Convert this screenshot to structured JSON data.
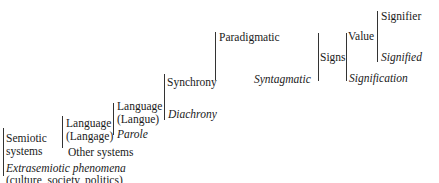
{
  "diagram": {
    "type": "hierarchical-bracket-tree",
    "nodes": {
      "semiotic_systems_1": "Semiotic",
      "semiotic_systems_2": "systems",
      "extrasemiotic": "Extrasemiotic phenomena",
      "extrasemiotic_sub": "(culture, society, politics)",
      "language_langage_1": "Language",
      "language_langage_2": "(Langage)",
      "other_systems": "Other systems",
      "language_langue_1": "Language",
      "language_langue_2": "(Langue)",
      "parole": "Parole",
      "synchrony": "Synchrony",
      "diachrony": "Diachrony",
      "paradigmatic": "Paradigmatic",
      "syntagmatic": "Syntagmatic",
      "signs": "Signs",
      "value": "Value",
      "signification": "Signification",
      "signifier": "Signifier",
      "signified": "Signified"
    }
  }
}
